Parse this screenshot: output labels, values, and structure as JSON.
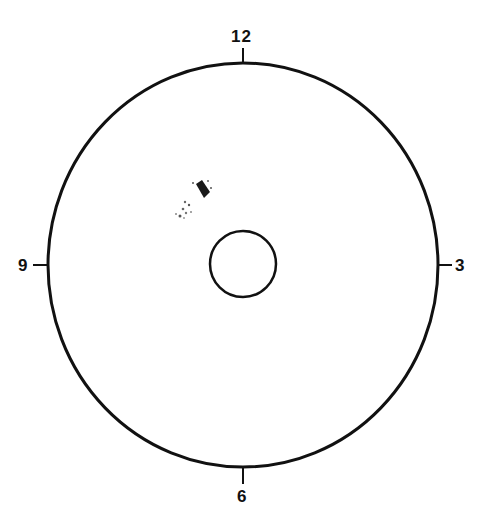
{
  "diagram": {
    "title": "",
    "clock_labels": {
      "top": "12",
      "right": "3",
      "bottom": "6",
      "left": "9"
    },
    "outer_ellipse": {
      "cx": 243,
      "cy": 265,
      "rx": 195,
      "ry": 202,
      "stroke": "#111111"
    },
    "inner_circle": {
      "cx": 243,
      "cy": 264,
      "r": 33,
      "stroke": "#111111"
    },
    "marking": {
      "description": "small dark diamond-shaped mark with speckles at approximately 10-11 o'clock position",
      "color": "#222222"
    }
  }
}
